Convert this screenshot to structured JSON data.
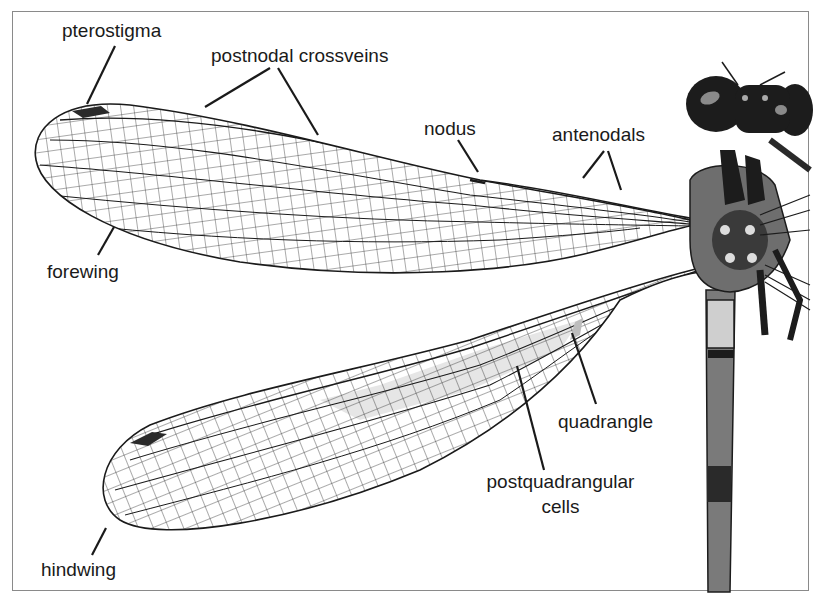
{
  "figure": {
    "colors": {
      "background": "#ffffff",
      "frame": "#8a8a8a",
      "vein": "#1a1a1a",
      "pterostigma": "#2a2a2a",
      "label_text": "#1a1a1a",
      "shaded_cells": "#e6e6e6",
      "body_dark": "#1c1c1c",
      "body_mid": "#7a7a7a"
    }
  },
  "labels": {
    "pterostigma": "pterostigma",
    "postnodal_crossveins": "postnodal crossveins",
    "nodus": "nodus",
    "antenodals": "antenodals",
    "forewing": "forewing",
    "hindwing": "hindwing",
    "quadrangle": "quadrangle",
    "postquadrangular_line1": "postquadrangular",
    "postquadrangular_line2": "cells"
  }
}
